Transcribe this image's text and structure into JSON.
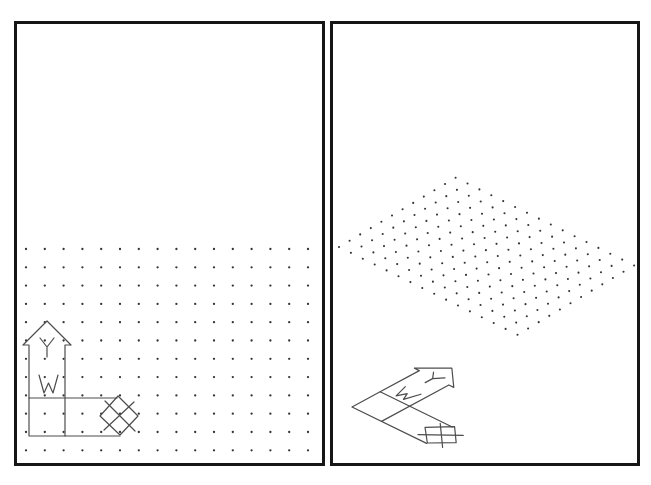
{
  "figure": {
    "background": "#ffffff",
    "frame_color": "#161616",
    "frame_stroke_width": 3
  },
  "panels": {
    "plan": {
      "label": "plan-view-viewport",
      "x": 15.5,
      "y": 22.5,
      "width": 308,
      "height": 442
    },
    "iso": {
      "label": "isometric-view-viewport",
      "x": 331.5,
      "y": 22.5,
      "width": 307,
      "height": 442
    }
  },
  "grids": {
    "dot_color": "#333333",
    "plan": {
      "cols": 16,
      "rows": 12,
      "origin": [
        26,
        249
      ],
      "u": [
        18.8,
        0
      ],
      "v": [
        0,
        18.3
      ],
      "dot_radius": 1.15
    },
    "iso": {
      "cols": 16,
      "rows": 12,
      "origin": [
        339,
        247
      ],
      "u": [
        11.9,
        5.85
      ],
      "v": [
        10.6,
        -6.3
      ],
      "dot_radius": 1.05
    }
  },
  "ucs_icon": {
    "stroke_color": "#4d4d4d",
    "stroke_width": 1.2,
    "x_axis_label": "X",
    "y_axis_label": "Y",
    "world_label": "W",
    "plan_matrix": [
      1,
      0,
      0,
      -1,
      29,
      436
    ],
    "iso_matrix": [
      0.82,
      0.4,
      0.74,
      -0.4,
      352,
      407
    ]
  }
}
